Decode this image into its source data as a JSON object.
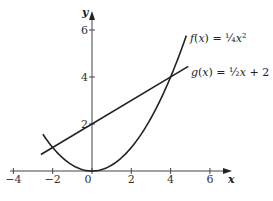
{
  "chart_data": {
    "type": "line",
    "title": "",
    "xlabel": "x",
    "ylabel": "y",
    "xlim": [
      -4,
      7
    ],
    "ylim": [
      0,
      6.5
    ],
    "grid": false,
    "x_ticks": [
      -4,
      -2,
      0,
      2,
      4,
      6
    ],
    "x_tick_labels": [
      "−4",
      "−2",
      "0",
      "2",
      "4",
      "6"
    ],
    "y_ticks": [
      2,
      4,
      6
    ],
    "y_tick_labels": [
      "2",
      "4",
      "6"
    ],
    "series": [
      {
        "name": "f(x) = 1/4 x^2",
        "label_text": {
          "prefix": "f(x) = ",
          "frac": "¼",
          "var": "x",
          "sup": "2"
        },
        "kind": "parabola",
        "x": [
          -2.5,
          -2,
          -1,
          0,
          1,
          2,
          3,
          4,
          4.8
        ],
        "y": [
          1.5625,
          1,
          0.25,
          0,
          0.25,
          1,
          2.25,
          4,
          5.76
        ]
      },
      {
        "name": "g(x) = 1/2 x + 2",
        "label_text": {
          "prefix": "g(x) = ",
          "frac": "½",
          "var": "x",
          "suffix": " + 2"
        },
        "kind": "line",
        "x": [
          -2.6,
          4.9
        ],
        "y": [
          0.7,
          4.45
        ]
      }
    ],
    "intersections": [
      [
        -2,
        1
      ],
      [
        4,
        4
      ]
    ],
    "legend_position": "inline-right"
  }
}
